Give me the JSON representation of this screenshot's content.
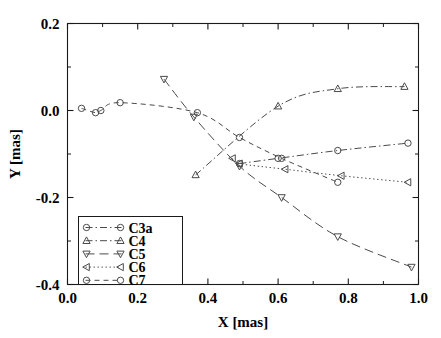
{
  "chart_data": {
    "type": "line",
    "title": "",
    "xlabel": "X [mas]",
    "ylabel": "Y [mas]",
    "xlim": [
      0.0,
      1.0
    ],
    "ylim": [
      -0.4,
      0.2
    ],
    "xticks": [
      "0.0",
      "0.2",
      "0.4",
      "0.6",
      "0.8",
      "1.0"
    ],
    "xtick_values": [
      0.0,
      0.2,
      0.4,
      0.6,
      0.8,
      1.0
    ],
    "yticks": [
      "0.2",
      "0.0",
      "-0.2",
      "-0.4"
    ],
    "ytick_values": [
      0.2,
      0.0,
      -0.2,
      -0.4
    ],
    "grid": false,
    "legend_position": "lower-left",
    "series": [
      {
        "name": "C3a",
        "marker": "circle",
        "linestyle": "dashdot",
        "color": "#4a4a4a",
        "x": [
          0.49,
          0.6,
          0.77,
          0.97
        ],
        "y": [
          -0.122,
          -0.11,
          -0.092,
          -0.075
        ]
      },
      {
        "name": "C4",
        "marker": "triangle-up",
        "linestyle": "dashdot",
        "color": "#4a4a4a",
        "x": [
          0.365,
          0.6,
          0.77,
          0.96
        ],
        "y": [
          -0.148,
          0.01,
          0.05,
          0.055
        ]
      },
      {
        "name": "C5",
        "marker": "triangle-down",
        "linestyle": "dashed-long",
        "color": "#4a4a4a",
        "x": [
          0.275,
          0.36,
          0.49,
          0.61,
          0.77,
          0.98
        ],
        "y": [
          0.072,
          -0.015,
          -0.128,
          -0.2,
          -0.29,
          -0.36
        ]
      },
      {
        "name": "C6",
        "marker": "triangle-left",
        "linestyle": "dotted",
        "color": "#4a4a4a",
        "x": [
          0.47,
          0.49,
          0.62,
          0.78,
          0.97
        ],
        "y": [
          -0.11,
          -0.122,
          -0.135,
          -0.15,
          -0.165
        ]
      },
      {
        "name": "C7",
        "marker": "circle",
        "linestyle": "dashed",
        "color": "#4a4a4a",
        "x": [
          0.04,
          0.08,
          0.095,
          0.15,
          0.37,
          0.49,
          0.61,
          0.77
        ],
        "y": [
          0.005,
          -0.005,
          0.0,
          0.018,
          -0.005,
          -0.062,
          -0.11,
          -0.165
        ]
      }
    ]
  },
  "legend": {
    "entries": [
      {
        "label": "C3a"
      },
      {
        "label": "C4"
      },
      {
        "label": "C5"
      },
      {
        "label": "C6"
      },
      {
        "label": "C7"
      }
    ]
  }
}
